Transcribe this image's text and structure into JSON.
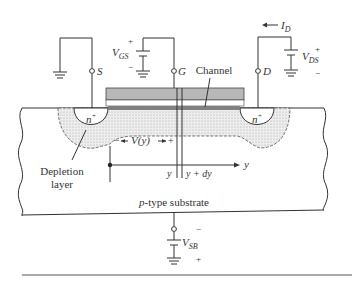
{
  "diagram": {
    "terminals": {
      "source": "S",
      "gate": "G",
      "drain": "D"
    },
    "sources": {
      "vgs": {
        "label": "V",
        "sub": "GS",
        "plus": "+",
        "minus": "−"
      },
      "vds": {
        "label": "V",
        "sub": "DS",
        "plus": "+",
        "minus": "−"
      },
      "vsb": {
        "label": "V",
        "sub": "SB",
        "plus": "+",
        "minus": "−"
      }
    },
    "current": {
      "label": "I",
      "sub": "D"
    },
    "regions": {
      "n_source": "n",
      "n_drain": "n",
      "n_sup": "+",
      "channel": "Channel",
      "depletion_line1": "Depletion",
      "depletion_line2": "layer",
      "substrate_p": "p",
      "substrate_rest": "-type substrate"
    },
    "annotations": {
      "vy": "V(y)",
      "vy_minus": "−",
      "vy_plus": "+",
      "y_axis": "y",
      "y_pos": "y",
      "y_dy": "y + dy"
    },
    "colors": {
      "gate": "#b8b8b8",
      "channel": "#808080",
      "depletion": "#e6e6e6",
      "line": "#333333"
    }
  }
}
